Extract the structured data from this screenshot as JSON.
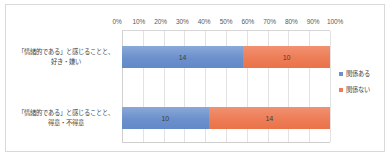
{
  "chart_data": {
    "type": "bar",
    "subtype": "100% stacked horizontal bar",
    "title": "",
    "xlabel": "",
    "ylabel": "",
    "xlim": [
      0,
      100
    ],
    "grid": true,
    "legend_position": "right",
    "tick_labels": [
      "0%",
      "10%",
      "20%",
      "30%",
      "40%",
      "50%",
      "60%",
      "70%",
      "80%",
      "90%",
      "100%"
    ],
    "tick_values": [
      0,
      10,
      20,
      30,
      40,
      50,
      60,
      70,
      80,
      90,
      100
    ],
    "categories": [
      "「情緒的である」と感じることと、好き・嫌い",
      "「情緒的である」と感じることと、得意・不得意"
    ],
    "category_lines": [
      [
        "「情緒的である」と感じることと、",
        "好き・嫌い"
      ],
      [
        "「情緒的である」と感じることと、",
        "得意・不得意"
      ]
    ],
    "series": [
      {
        "name": "関係ある",
        "color": "#6b90cc",
        "values": [
          14,
          10
        ],
        "percents": [
          58.3,
          41.7
        ]
      },
      {
        "name": "関係ない",
        "color": "#ed7d56",
        "values": [
          10,
          14
        ],
        "percents": [
          41.7,
          58.3
        ]
      }
    ],
    "totals": [
      24,
      24
    ]
  }
}
